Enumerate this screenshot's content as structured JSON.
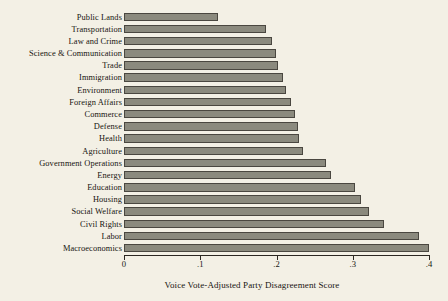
{
  "chart_data": {
    "type": "bar",
    "orientation": "horizontal",
    "title": "",
    "xlabel": "Voice Vote-Adjusted Party Disagreement Score",
    "ylabel": "",
    "xlim": [
      0,
      0.4
    ],
    "xticks": [
      0,
      0.1,
      0.2,
      0.3,
      0.4
    ],
    "xtick_labels": [
      "0",
      ".1",
      ".2",
      ".3",
      ".4"
    ],
    "grid": false,
    "legend": false,
    "bar_color": "#8b8a7e",
    "bar_edge_color": "#4a4740",
    "background_color": "#f3f0e5",
    "categories": [
      "Public Lands",
      "Transportation",
      "Law and Crime",
      "Science & Communication",
      "Trade",
      "Immigration",
      "Environment",
      "Foreign Affairs",
      "Commerce",
      "Defense",
      "Health",
      "Agriculture",
      "Government Operations",
      "Energy",
      "Education",
      "Housing",
      "Social Welfare",
      "Civil Rights",
      "Labor",
      "Macroeconomics"
    ],
    "values": [
      0.123,
      0.186,
      0.194,
      0.199,
      0.202,
      0.208,
      0.212,
      0.219,
      0.224,
      0.228,
      0.23,
      0.235,
      0.265,
      0.271,
      0.303,
      0.311,
      0.321,
      0.341,
      0.387,
      0.4
    ]
  }
}
